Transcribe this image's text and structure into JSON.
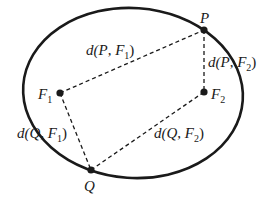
{
  "colors": {
    "stroke": "#1a1a1a",
    "background": "#ffffff"
  },
  "ellipse": {
    "cx": 133,
    "cy": 93,
    "rx": 110,
    "ry": 85
  },
  "points": {
    "P": {
      "label": "P",
      "x": 204,
      "y": 30
    },
    "F1": {
      "label": "F",
      "sub": "1",
      "x": 60,
      "y": 93
    },
    "F2": {
      "label": "F",
      "sub": "2",
      "x": 204,
      "y": 92
    },
    "Q": {
      "label": "Q",
      "x": 91,
      "y": 170
    }
  },
  "distances": {
    "PF1": {
      "pre": "d(",
      "a": "P",
      "sep": ", ",
      "b": "F",
      "sub": "1",
      "post": ")"
    },
    "PF2": {
      "pre": "d(",
      "a": "P",
      "sep": ", ",
      "b": "F",
      "sub": "2",
      "post": ")"
    },
    "QF1": {
      "pre": "d(",
      "a": "Q",
      "sep": ", ",
      "b": "F",
      "sub": "1",
      "post": ")"
    },
    "QF2": {
      "pre": "d(",
      "a": "Q",
      "sep": ", ",
      "b": "F",
      "sub": "2",
      "post": ")"
    }
  }
}
